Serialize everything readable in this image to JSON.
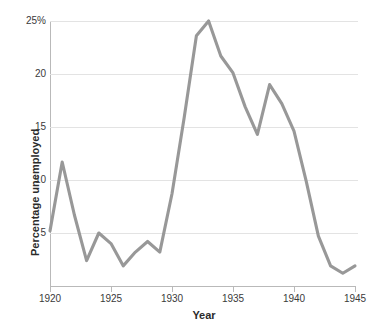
{
  "chart_data": {
    "type": "line",
    "title": "",
    "xlabel": "Year",
    "ylabel": "Percentage unemployed",
    "xlim": [
      1920,
      1945
    ],
    "ylim": [
      0,
      25
    ],
    "grid": true,
    "legend": "none",
    "line_color": "#989898",
    "gridline_color": "#e3e3e3",
    "axis_color": "#b9b9b9",
    "x_ticks": [
      1920,
      1925,
      1930,
      1935,
      1940,
      1945
    ],
    "x_tick_labels": [
      "1920",
      "1925",
      "1930",
      "1935",
      "1940",
      "1945"
    ],
    "y_ticks": [
      5,
      10,
      15,
      20,
      25
    ],
    "y_tick_labels": [
      "5",
      "10",
      "15",
      "20",
      "25%"
    ],
    "x": [
      1920,
      1921,
      1922,
      1923,
      1924,
      1925,
      1926,
      1927,
      1928,
      1929,
      1930,
      1931,
      1932,
      1933,
      1934,
      1935,
      1936,
      1937,
      1938,
      1939,
      1940,
      1941,
      1942,
      1943,
      1944,
      1945
    ],
    "values": [
      5.2,
      11.7,
      6.7,
      2.4,
      5.0,
      4.0,
      1.9,
      3.2,
      4.2,
      3.2,
      8.7,
      15.9,
      23.6,
      25.0,
      21.7,
      20.1,
      16.9,
      14.3,
      19.0,
      17.2,
      14.6,
      9.9,
      4.7,
      1.9,
      1.2,
      1.9
    ],
    "series_name": "Percentage unemployed",
    "caption_fragment": ""
  },
  "axes": {
    "y_title": "Percentage unemployed",
    "x_title": "Year"
  }
}
